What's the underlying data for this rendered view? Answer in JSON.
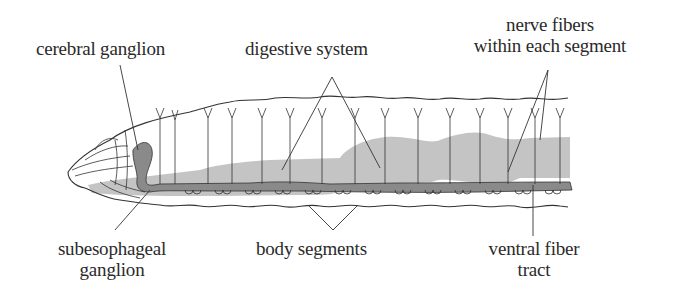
{
  "diagram": {
    "colors": {
      "background": "#ffffff",
      "outline": "#333333",
      "digestive_system": "#c4c4c4",
      "nerve_cord": "#8a8a8a",
      "text": "#2a2a2a"
    },
    "labels": {
      "cerebral_ganglion": "cerebral ganglion",
      "digestive_system": "digestive system",
      "nerve_fibers_line1": "nerve fibers",
      "nerve_fibers_line2": "within each segment",
      "subesophageal_line1": "subesophageal",
      "subesophageal_line2": "ganglion",
      "body_segments": "body segments",
      "ventral_fiber_line1": "ventral fiber",
      "ventral_fiber_line2": "tract"
    }
  }
}
